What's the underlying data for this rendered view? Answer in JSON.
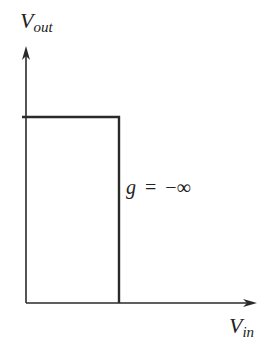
{
  "diagram": {
    "y_axis": {
      "main": "V",
      "sub": "out"
    },
    "x_axis": {
      "main": "V",
      "sub": "in"
    },
    "annotation": {
      "var": "g",
      "op": "=",
      "value": "−∞"
    },
    "colors": {
      "line": "#2a2a2a",
      "text": "#222222",
      "background": "#ffffff"
    }
  }
}
